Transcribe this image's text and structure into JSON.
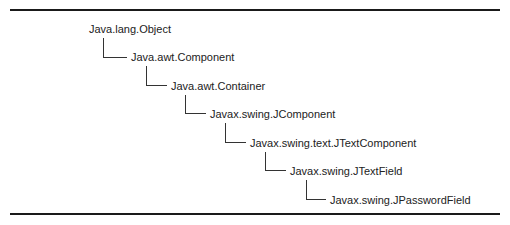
{
  "diagram": {
    "type": "class-hierarchy",
    "nodes": [
      {
        "label": "Java.lang.Object"
      },
      {
        "label": "Java.awt.Component"
      },
      {
        "label": "Java.awt.Container"
      },
      {
        "label": "Javax.swing.JComponent"
      },
      {
        "label": "Javax.swing.text.JTextComponent"
      },
      {
        "label": "Javax.swing.JTextField"
      },
      {
        "label": "Javax.swing.JPasswordField"
      }
    ],
    "edges": [
      {
        "from": "Java.lang.Object",
        "to": "Java.awt.Component"
      },
      {
        "from": "Java.awt.Component",
        "to": "Java.awt.Container"
      },
      {
        "from": "Java.awt.Container",
        "to": "Javax.swing.JComponent"
      },
      {
        "from": "Javax.swing.JComponent",
        "to": "Javax.swing.text.JTextComponent"
      },
      {
        "from": "Javax.swing.text.JTextComponent",
        "to": "Javax.swing.JTextField"
      },
      {
        "from": "Javax.swing.JTextField",
        "to": "Javax.swing.JPasswordField"
      }
    ]
  }
}
